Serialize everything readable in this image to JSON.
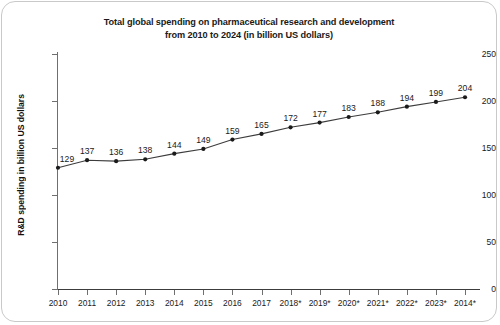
{
  "chart_data": {
    "type": "line",
    "title": "Total global spending on pharmaceutical research and development from 2010 to 2024 (in billion US dollars)",
    "title_line1": "Total global spending on pharmaceutical research and development",
    "title_line2": "from 2010 to 2024 (in billion US dollars)",
    "xlabel": "",
    "ylabel": "R&D spending in billion US dollars",
    "categories": [
      "2010",
      "2011",
      "2012",
      "2013",
      "2014",
      "2015",
      "2016",
      "2017",
      "2018*",
      "2019*",
      "2020*",
      "2021*",
      "2022*",
      "2023*",
      "2014*"
    ],
    "values": [
      129,
      137,
      136,
      138,
      144,
      149,
      159,
      165,
      172,
      177,
      183,
      188,
      194,
      199,
      204
    ],
    "point_labels": [
      "129",
      "137",
      "136",
      "138",
      "144",
      "149",
      "159",
      "165",
      "172",
      "177",
      "183",
      "188",
      "194",
      "199",
      "204"
    ],
    "ylim": [
      0,
      250
    ],
    "yticks": [
      0,
      50,
      100,
      150,
      200,
      250
    ],
    "ytick_labels": [
      "0",
      "50",
      "100",
      "150",
      "200",
      "250"
    ],
    "grid": false,
    "legend": false,
    "series_color": "#3c3c3c",
    "marker_color": "#1a1a1a",
    "axis_color": "#6f6f6f",
    "text_color": "#1a1a1a",
    "background": "#ffffff"
  }
}
